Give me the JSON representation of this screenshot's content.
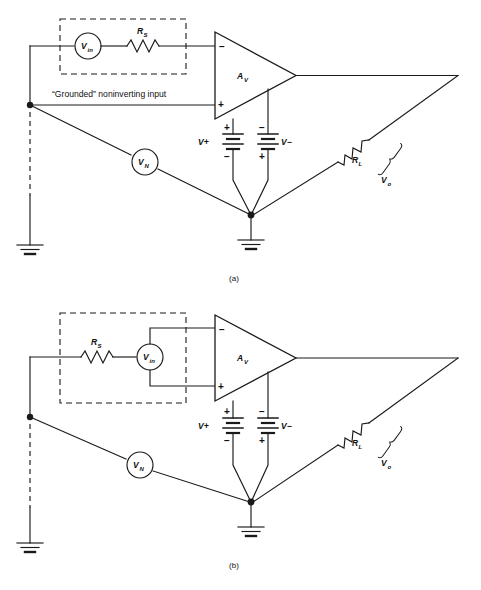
{
  "figure": {
    "panels": [
      {
        "id": "a",
        "caption": "(a)",
        "note_label": "“Grounded” noninverting input",
        "components": {
          "source_in": "V",
          "source_in_sub": "in",
          "source_noise": "V",
          "source_noise_sub": "N",
          "resistor_source": "R",
          "resistor_source_sub": "S",
          "resistor_load": "R",
          "resistor_load_sub": "L",
          "amplifier_gain": "A",
          "amplifier_gain_sub": "V",
          "output_voltage": "V",
          "output_voltage_sub": "o",
          "supply_positive": "V+",
          "supply_negative": "V−",
          "input_inverting": "−",
          "input_noninverting": "+",
          "battery_pos_terminal": "+",
          "battery_neg_terminal": "−"
        }
      },
      {
        "id": "b",
        "caption": "(b)",
        "note_label": "",
        "components": {
          "source_in": "V",
          "source_in_sub": "in",
          "source_noise": "V",
          "source_noise_sub": "N",
          "resistor_source": "R",
          "resistor_source_sub": "S",
          "resistor_load": "R",
          "resistor_load_sub": "L",
          "amplifier_gain": "A",
          "amplifier_gain_sub": "V",
          "output_voltage": "V",
          "output_voltage_sub": "o",
          "supply_positive": "V+",
          "supply_negative": "V−",
          "input_inverting": "−",
          "input_noninverting": "+",
          "battery_pos_terminal": "+",
          "battery_neg_terminal": "−"
        }
      }
    ],
    "colors": {
      "ink": "#1a1a1a",
      "paper": "#ffffff"
    }
  }
}
